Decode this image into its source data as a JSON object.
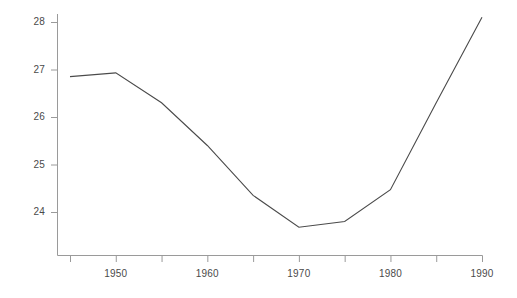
{
  "chart_data": {
    "type": "line",
    "title": "",
    "subtitle": "",
    "xlabel": "",
    "ylabel": "",
    "x": [
      1945,
      1950,
      1955,
      1960,
      1965,
      1970,
      1975,
      1980,
      1985,
      1990
    ],
    "values": [
      26.85,
      26.93,
      26.3,
      25.4,
      24.35,
      23.68,
      23.8,
      24.47,
      26.3,
      28.1
    ],
    "series": [
      {
        "name": "series-1",
        "color": "#4a4a4a",
        "values": [
          26.85,
          26.93,
          26.3,
          25.4,
          24.35,
          23.68,
          23.8,
          24.47,
          26.3,
          28.1
        ]
      }
    ],
    "xlim": [
      1945,
      1990
    ],
    "ylim": [
      23.3,
      28.25
    ],
    "grid": false,
    "legend": false,
    "legend_position": "none",
    "x_tick_labels": [
      "1950",
      "1960",
      "1970",
      "1980",
      "1990"
    ],
    "x_tick_values": [
      1950,
      1960,
      1970,
      1980,
      1990
    ],
    "x_minor_tick_values": [
      1945,
      1955,
      1965,
      1975,
      1985
    ],
    "y_tick_labels": [
      "24",
      "25",
      "26",
      "27",
      "28"
    ],
    "y_tick_values": [
      24,
      25,
      26,
      27,
      28
    ],
    "line_color": "#4a4a4a",
    "axis_color": "#9a9a9a",
    "background_color": "#ffffff"
  }
}
